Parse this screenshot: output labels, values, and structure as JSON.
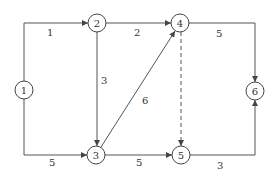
{
  "diagram": {
    "type": "activity-on-arrow network",
    "nodes": [
      {
        "id": "1",
        "label": "1",
        "x": 24,
        "y": 90
      },
      {
        "id": "2",
        "label": "2",
        "x": 97,
        "y": 23
      },
      {
        "id": "3",
        "label": "3",
        "x": 96,
        "y": 155
      },
      {
        "id": "4",
        "label": "4",
        "x": 180,
        "y": 23
      },
      {
        "id": "5",
        "label": "5",
        "x": 181,
        "y": 155
      },
      {
        "id": "6",
        "label": "6",
        "x": 255,
        "y": 91
      }
    ],
    "edges": [
      {
        "from": "1",
        "to": "2",
        "label": "1",
        "style": "solid"
      },
      {
        "from": "1",
        "to": "3",
        "label": "5",
        "style": "solid"
      },
      {
        "from": "2",
        "to": "3",
        "label": "3",
        "style": "solid"
      },
      {
        "from": "2",
        "to": "4",
        "label": "2",
        "style": "solid"
      },
      {
        "from": "3",
        "to": "4",
        "label": "6",
        "style": "solid"
      },
      {
        "from": "3",
        "to": "5",
        "label": "5",
        "style": "solid"
      },
      {
        "from": "4",
        "to": "5",
        "label": "",
        "style": "dashed"
      },
      {
        "from": "4",
        "to": "6",
        "label": "5",
        "style": "solid"
      },
      {
        "from": "5",
        "to": "6",
        "label": "3",
        "style": "solid"
      }
    ]
  }
}
